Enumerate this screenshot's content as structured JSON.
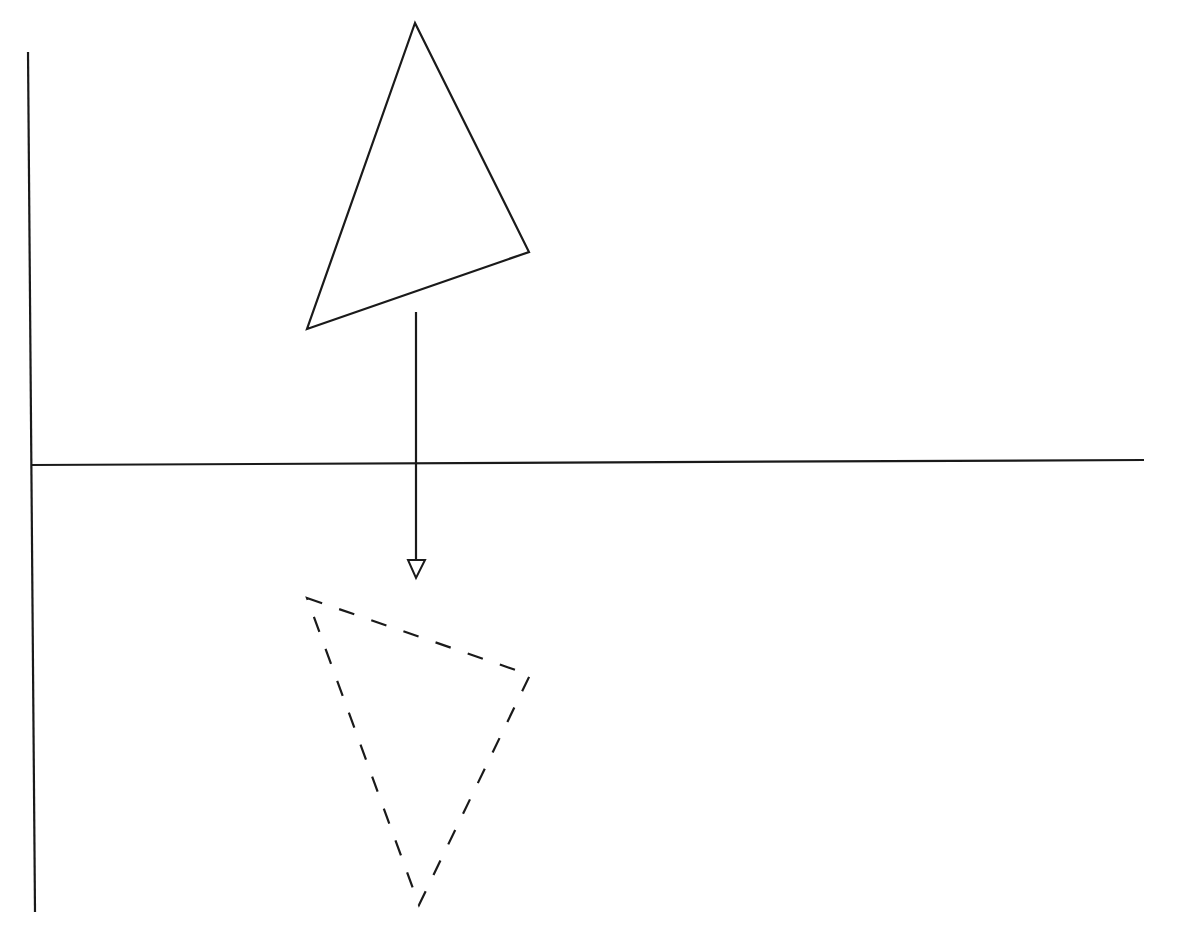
{
  "diagram": {
    "colors": {
      "background": "#ffffff",
      "stroke": "#1a1a1a"
    },
    "axes": {
      "vertical": {
        "x1": 28,
        "y1": 52,
        "x2": 35,
        "y2": 912
      },
      "horizontal": {
        "x1": 32,
        "y1": 465,
        "x2": 1144,
        "y2": 460
      }
    },
    "original_triangle": {
      "style": "solid",
      "points": [
        [
          415,
          23
        ],
        [
          529,
          252
        ],
        [
          307,
          329
        ]
      ]
    },
    "reflected_triangle": {
      "style": "dashed",
      "points": [
        [
          307,
          598
        ],
        [
          530,
          675
        ],
        [
          419,
          905
        ]
      ]
    },
    "arrow": {
      "x1": 416,
      "y1": 312,
      "x2": 416,
      "y2": 560,
      "head": {
        "style": "open-triangle",
        "points": [
          [
            408,
            560
          ],
          [
            425,
            560
          ],
          [
            416,
            578
          ]
        ]
      }
    }
  }
}
